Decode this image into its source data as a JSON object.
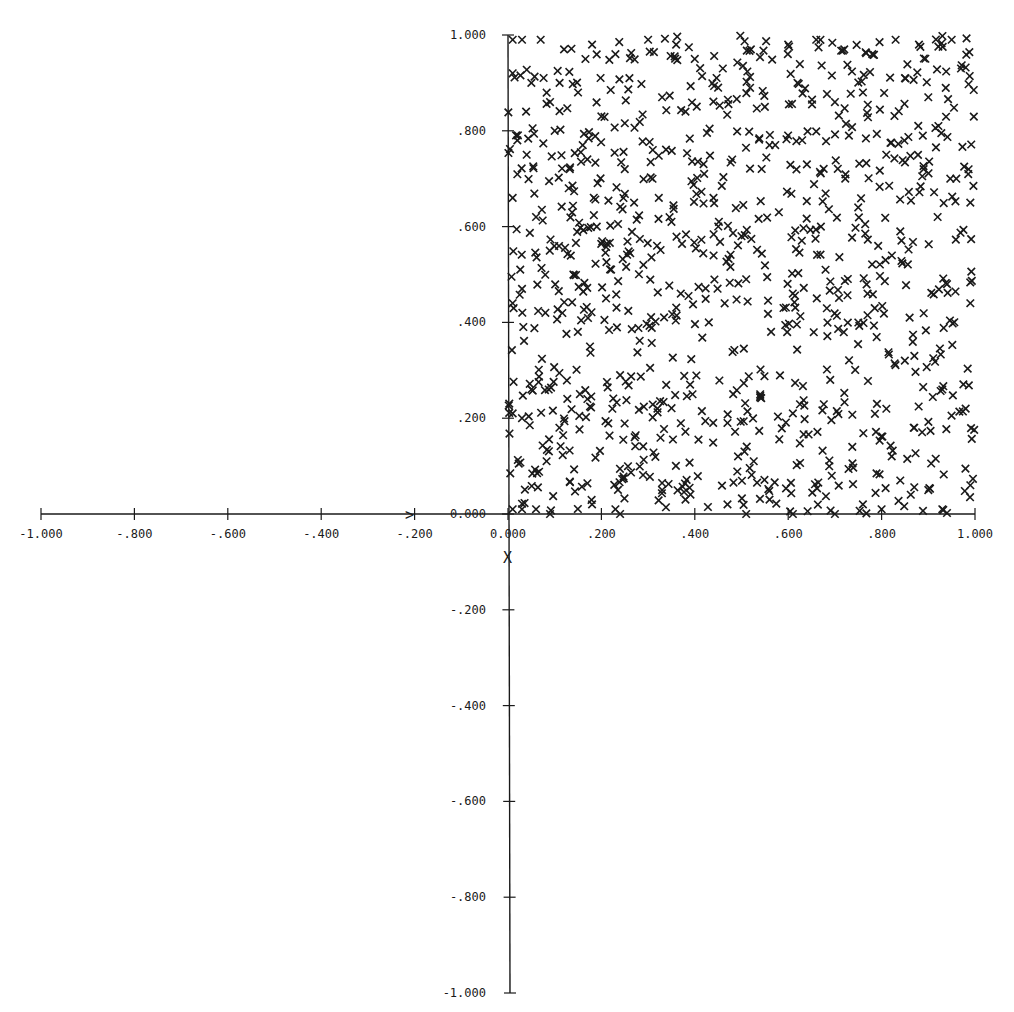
{
  "chart_data": {
    "type": "scatter",
    "title": "",
    "xlabel": "",
    "ylabel": "",
    "xlim": [
      -1.0,
      1.0
    ],
    "ylim": [
      -1.0,
      1.0
    ],
    "grid": false,
    "legend": null,
    "marker": "x",
    "x_ticks": [
      -1.0,
      -0.8,
      -0.6,
      -0.4,
      -0.2,
      0.0,
      0.2,
      0.4,
      0.6,
      0.8,
      1.0
    ],
    "x_tick_labels": [
      "-1.000",
      "-.800",
      "-.600",
      "-.400",
      "-.200",
      "0.000",
      ".200",
      ".400",
      ".600",
      ".800",
      "1.000"
    ],
    "y_ticks": [
      1.0,
      0.8,
      0.6,
      0.4,
      0.2,
      0.0,
      -0.2,
      -0.4,
      -0.6,
      -0.8,
      -1.0
    ],
    "y_tick_labels": [
      "1.000",
      ".800",
      ".600",
      ".400",
      ".200",
      "0.000",
      "-.200",
      "-.400",
      "-.600",
      "-.800",
      "-1.000"
    ],
    "annotations": [
      {
        "text": "X",
        "x": 0.0,
        "y": -0.09,
        "note": "axis marker below origin"
      },
      {
        "text": ">",
        "x": -0.21,
        "y": 0.0,
        "note": "arrow marker on x-axis"
      }
    ],
    "series": [
      {
        "name": "uniform random points",
        "approx_count": 1000,
        "distribution": "uniform on [0,1] x [0,1]",
        "sample_points": [
          [
            0.01,
            0.99
          ],
          [
            0.03,
            0.99
          ],
          [
            0.07,
            0.99
          ],
          [
            0.12,
            0.97
          ],
          [
            0.18,
            0.98
          ],
          [
            0.23,
            0.96
          ],
          [
            0.3,
            0.99
          ],
          [
            0.36,
            0.98
          ],
          [
            0.4,
            0.95
          ],
          [
            0.46,
            0.93
          ],
          [
            0.52,
            0.97
          ],
          [
            0.6,
            0.98
          ],
          [
            0.66,
            0.99
          ],
          [
            0.72,
            0.97
          ],
          [
            0.78,
            0.96
          ],
          [
            0.83,
            0.99
          ],
          [
            0.88,
            0.98
          ],
          [
            0.95,
            0.99
          ],
          [
            0.01,
            0.92
          ],
          [
            0.05,
            0.9
          ],
          [
            0.09,
            0.86
          ],
          [
            0.15,
            0.88
          ],
          [
            0.2,
            0.83
          ],
          [
            0.26,
            0.91
          ],
          [
            0.33,
            0.87
          ],
          [
            0.38,
            0.84
          ],
          [
            0.45,
            0.89
          ],
          [
            0.55,
            0.85
          ],
          [
            0.62,
            0.9
          ],
          [
            0.7,
            0.86
          ],
          [
            0.76,
            0.88
          ],
          [
            0.85,
            0.91
          ],
          [
            0.9,
            0.87
          ],
          [
            0.97,
            0.93
          ],
          [
            0.02,
            0.78
          ],
          [
            0.04,
            0.75
          ],
          [
            0.1,
            0.8
          ],
          [
            0.16,
            0.77
          ],
          [
            0.25,
            0.72
          ],
          [
            0.31,
            0.76
          ],
          [
            0.42,
            0.71
          ],
          [
            0.48,
            0.74
          ],
          [
            0.56,
            0.77
          ],
          [
            0.64,
            0.73
          ],
          [
            0.73,
            0.79
          ],
          [
            0.81,
            0.75
          ],
          [
            0.89,
            0.72
          ],
          [
            0.96,
            0.7
          ],
          [
            0.01,
            0.66
          ],
          [
            0.06,
            0.62
          ],
          [
            0.13,
            0.68
          ],
          [
            0.19,
            0.6
          ],
          [
            0.27,
            0.65
          ],
          [
            0.35,
            0.61
          ],
          [
            0.44,
            0.66
          ],
          [
            0.5,
            0.58
          ],
          [
            0.58,
            0.63
          ],
          [
            0.67,
            0.6
          ],
          [
            0.75,
            0.64
          ],
          [
            0.84,
            0.59
          ],
          [
            0.92,
            0.62
          ],
          [
            0.99,
            0.65
          ],
          [
            0.01,
            0.44
          ],
          [
            0.03,
            0.47
          ],
          [
            0.08,
            0.42
          ],
          [
            0.14,
            0.5
          ],
          [
            0.21,
            0.45
          ],
          [
            0.29,
            0.52
          ],
          [
            0.37,
            0.46
          ],
          [
            0.43,
            0.4
          ],
          [
            0.51,
            0.49
          ],
          [
            0.59,
            0.43
          ],
          [
            0.68,
            0.51
          ],
          [
            0.77,
            0.46
          ],
          [
            0.86,
            0.41
          ],
          [
            0.94,
            0.48
          ],
          [
            0.99,
            0.44
          ],
          [
            0.01,
            0.21
          ],
          [
            0.03,
            0.2
          ],
          [
            0.05,
            0.26
          ],
          [
            0.11,
            0.18
          ],
          [
            0.17,
            0.24
          ],
          [
            0.24,
            0.29
          ],
          [
            0.32,
            0.22
          ],
          [
            0.39,
            0.27
          ],
          [
            0.47,
            0.19
          ],
          [
            0.54,
            0.25
          ],
          [
            0.61,
            0.21
          ],
          [
            0.69,
            0.28
          ],
          [
            0.79,
            0.23
          ],
          [
            0.87,
            0.18
          ],
          [
            0.93,
            0.26
          ],
          [
            0.98,
            0.22
          ],
          [
            0.01,
            0.01
          ],
          [
            0.03,
            0.01
          ],
          [
            0.06,
            0.01
          ],
          [
            0.09,
            0.0
          ],
          [
            0.18,
            0.02
          ],
          [
            0.23,
            0.01
          ],
          [
            0.24,
            0.0
          ],
          [
            0.33,
            0.05
          ],
          [
            0.38,
            0.03
          ],
          [
            0.47,
            0.02
          ],
          [
            0.51,
            0.0
          ],
          [
            0.56,
            0.03
          ],
          [
            0.61,
            0.0
          ],
          [
            0.7,
            0.0
          ],
          [
            0.76,
            0.02
          ],
          [
            0.8,
            0.01
          ],
          [
            0.84,
            0.07
          ],
          [
            0.9,
            0.05
          ],
          [
            0.93,
            0.01
          ],
          [
            0.99,
            0.06
          ]
        ]
      }
    ]
  },
  "render": {
    "origin_px": [
      508,
      514
    ],
    "px_per_unit_x": 467,
    "px_per_unit_y": 479,
    "ink_color": "#1a1a1a",
    "background": "#ffffff",
    "random_seed": 1729
  }
}
